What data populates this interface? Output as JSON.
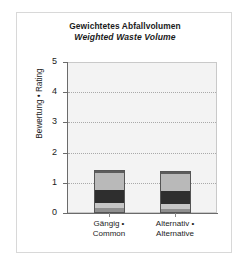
{
  "chart_data": {
    "type": "bar",
    "title": "Gewichtetes Abfallvolumen",
    "subtitle": "Weighted Waste Volume",
    "ylabel": "Bewertung • Rating",
    "xlabel": "",
    "ylim": [
      0,
      5
    ],
    "yticks": [
      "0",
      "1",
      "2",
      "3",
      "4",
      "5"
    ],
    "grid": true,
    "legend": "none",
    "categories": [
      "Gängig • Common",
      "Alternativ • Alternative"
    ],
    "category_lines": [
      [
        "Gängig •",
        "Common"
      ],
      [
        "Alternativ •",
        "Alternative"
      ]
    ],
    "stacked": true,
    "series": [
      {
        "name": "segment-1-base",
        "color": "#8f8f8f",
        "values": [
          0.13,
          0.12
        ]
      },
      {
        "name": "segment-2-light",
        "color": "#c6c6c6",
        "values": [
          0.17,
          0.16
        ]
      },
      {
        "name": "segment-3-dark",
        "color": "#2e2e2e",
        "values": [
          0.46,
          0.44
        ]
      },
      {
        "name": "segment-4-body",
        "color": "#b9b9b9",
        "values": [
          0.58,
          0.6
        ]
      },
      {
        "name": "segment-5-cap",
        "color": "#5c5c5c",
        "values": [
          0.08,
          0.08
        ]
      }
    ],
    "totals": [
      1.42,
      1.4
    ]
  },
  "colors": {
    "plot_background": "#f3f3f3",
    "frame_border": "#d8d8d8",
    "axis": "#6b6b6b",
    "gridline": "#a9a9a9",
    "text": "#1b1b1b"
  }
}
